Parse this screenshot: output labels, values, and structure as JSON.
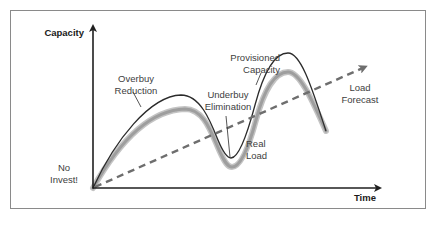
{
  "diagram": {
    "axes": {
      "y_label": "Capacity",
      "x_label": "Time"
    },
    "annotations": {
      "overbuy": [
        "Overbuy",
        "Reduction"
      ],
      "provisioned": [
        "Provisioned",
        "Capacity"
      ],
      "underbuy": [
        "Underbuy",
        "Elimination"
      ],
      "load_forecast": [
        "Load",
        "Forecast"
      ],
      "real_load": [
        "Real",
        "Load"
      ],
      "no_invest": [
        "No",
        "Invest!"
      ]
    },
    "series": [
      {
        "name": "Provisioned Capacity",
        "style": "solid thin",
        "color": "#2b2b2b"
      },
      {
        "name": "Real Load",
        "style": "solid thick",
        "color": "#a9a9a9"
      },
      {
        "name": "Load Forecast",
        "style": "dashed arrow",
        "color": "#6e6e6e"
      }
    ],
    "colors": {
      "frame": "#8a8a8a",
      "axis": "#1f1f1f",
      "capacity_line": "#2b2b2b",
      "real_load_line": "#a9a9a9",
      "forecast_line": "#6e6e6e"
    }
  }
}
